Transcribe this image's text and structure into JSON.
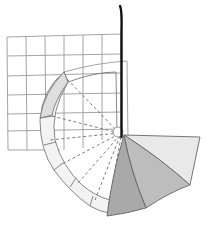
{
  "diagram": {
    "type": "geometric-illustration",
    "colors": {
      "background": "#ffffff",
      "grid_line": "#9a9a9a",
      "pole": "#111111",
      "band_fill": "#e6e6e6",
      "band_fill_light": "#f2f2f2",
      "dashed_line": "#6e6e6e",
      "panel_light": "#e9e9e9",
      "panel_mid": "#bdbdbd",
      "panel_dark": "#a8a8a8",
      "outline": "#666666"
    },
    "grid": {
      "columns": 6,
      "rows": 6,
      "x0": 7,
      "y0": 36,
      "x1": 121,
      "y1": 150
    },
    "pole": {
      "x": 121,
      "y_top": 6,
      "y_bottom": 137
    },
    "pivot": {
      "x": 122,
      "y": 135
    },
    "panels": [
      {
        "name": "light-panel",
        "shade": "light"
      },
      {
        "name": "middle-panel",
        "shade": "mid"
      },
      {
        "name": "dark-panel",
        "shade": "dark"
      }
    ]
  }
}
